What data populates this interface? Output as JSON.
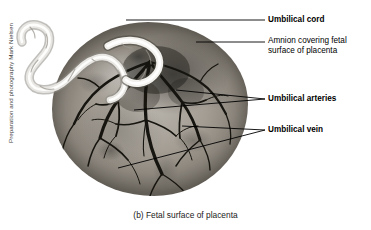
{
  "figure": {
    "caption": "(b) Fetal surface of placenta",
    "credit": "Preparation and photography Mark Nielsen",
    "background_color": "#ffffff",
    "leader_line_color": "#000000",
    "text_color": "#000000"
  },
  "labels": {
    "umbilical_cord": "Umbilical cord",
    "amnion": "Amnion covering fetal surface of placenta",
    "umbilical_arteries": "Umbilical arteries",
    "umbilical_vein": "Umbilical vein"
  }
}
